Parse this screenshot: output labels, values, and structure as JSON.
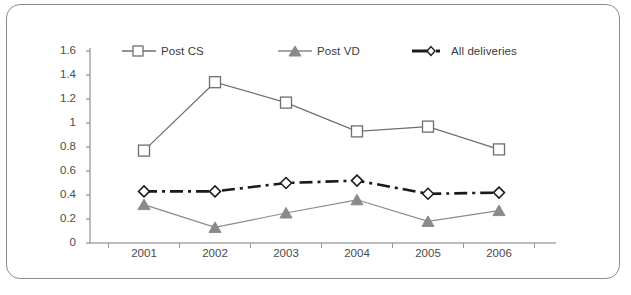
{
  "chart_data": {
    "type": "line",
    "title": "",
    "subtitle": "",
    "xlabel": "",
    "ylabel": "",
    "categories": [
      "2001",
      "2002",
      "2003",
      "2004",
      "2005",
      "2006"
    ],
    "ylim": [
      0,
      1.6
    ],
    "yticks": [
      "0",
      "0.2",
      "0.4",
      "0.6",
      "0.8",
      "1",
      "1.2",
      "1.4",
      "1.6"
    ],
    "ytick_values": [
      0,
      0.2,
      0.4,
      0.6,
      0.8,
      1.0,
      1.2,
      1.4,
      1.6
    ],
    "grid": false,
    "legend_position": "top",
    "series": [
      {
        "name": "Post CS",
        "values": [
          0.77,
          1.34,
          1.17,
          0.93,
          0.97,
          0.78
        ],
        "marker": "square-open",
        "line_style": "solid",
        "color": "#6e6e6e"
      },
      {
        "name": "Post VD",
        "values": [
          0.32,
          0.13,
          0.25,
          0.36,
          0.18,
          0.27
        ],
        "marker": "triangle-filled",
        "line_style": "solid",
        "color": "#8a8a8a"
      },
      {
        "name": "All deliveries",
        "values": [
          0.43,
          0.43,
          0.5,
          0.52,
          0.41,
          0.42
        ],
        "marker": "diamond-open",
        "line_style": "dash-dot",
        "color": "#1a1a1a"
      }
    ]
  },
  "legend": {
    "items": [
      {
        "label": "Post CS"
      },
      {
        "label": "Post VD"
      },
      {
        "label": "All deliveries"
      }
    ]
  },
  "axes": {
    "y_ticks": [
      "1.6",
      "1.4",
      "1.2",
      "1",
      "0.8",
      "0.6",
      "0.4",
      "0.2",
      "0"
    ],
    "x_ticks": [
      "2001",
      "2002",
      "2003",
      "2004",
      "2005",
      "2006"
    ]
  },
  "colors": {
    "frame": "#8c8c8c",
    "axis": "#7a7a7a",
    "post_cs": "#6e6e6e",
    "post_vd": "#8a8a8a",
    "all_deliveries": "#1a1a1a",
    "text": "#4a4a4a",
    "background": "#ffffff"
  }
}
